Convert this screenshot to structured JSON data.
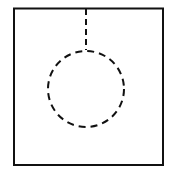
{
  "diagram": {
    "colors": {
      "stroke": "#111111",
      "background": "#ffffff"
    },
    "outer_rect": {
      "x": 13,
      "y": 8,
      "width": 150,
      "height": 157
    },
    "circle": {
      "cx": 86,
      "cy": 89,
      "r": 38,
      "style": "dashed"
    },
    "connector_line": {
      "x": 86,
      "y1": 8,
      "y2": 50,
      "style": "dashed"
    }
  }
}
